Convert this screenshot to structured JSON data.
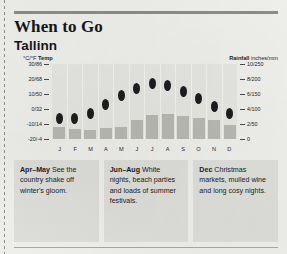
{
  "header": {
    "title": "When to Go",
    "subtitle": "Tallinn"
  },
  "chart_data": {
    "type": "bar",
    "categories": [
      "J",
      "F",
      "M",
      "A",
      "M",
      "J",
      "J",
      "A",
      "S",
      "O",
      "N",
      "D"
    ],
    "left_axis": {
      "label_bold": "°C/°F",
      "label_unit": "Temp",
      "ticks": [
        "30/86",
        "20/68",
        "10/50",
        "0/32",
        "-10/14",
        "-20/-4"
      ],
      "tick_values": [
        30,
        20,
        10,
        0,
        -10,
        -20
      ],
      "range": [
        -20,
        30
      ]
    },
    "right_axis": {
      "label_bold": "Rainfall",
      "label_unit": "inches/mm",
      "ticks": [
        "10/250",
        "8/200",
        "6/150",
        "4/100",
        "2/50",
        "0"
      ],
      "tick_values": [
        250,
        200,
        150,
        100,
        50,
        0
      ],
      "range": [
        0,
        250
      ]
    },
    "series": [
      {
        "name": "Temperature",
        "type": "scatter",
        "unit": "°C",
        "values": [
          -6,
          -6,
          -3,
          3,
          9,
          14,
          17,
          16,
          12,
          7,
          2,
          -3
        ]
      },
      {
        "name": "Rainfall",
        "type": "bar",
        "unit": "mm",
        "values": [
          40,
          32,
          30,
          36,
          40,
          62,
          80,
          84,
          77,
          70,
          62,
          48
        ]
      }
    ],
    "grid": false,
    "legend": "none"
  },
  "cards": [
    {
      "lead": "Apr–May",
      "text": " See the country shake off winter's gloom."
    },
    {
      "lead": "Jun–Aug",
      "text": " White nights, beach parties and loads of summer festivals."
    },
    {
      "lead": "Dec",
      "text": " Christmas markets, mulled wine and long cosy nights."
    }
  ]
}
